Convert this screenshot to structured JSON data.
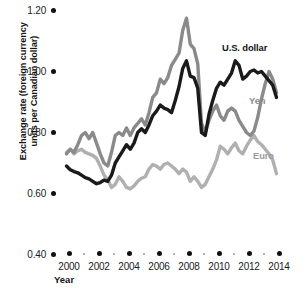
{
  "chart_data": {
    "type": "line",
    "title": "",
    "xlabel": "Year",
    "ylabel": "Exchange rate (foreign currency\nunits per Canadian dollar)",
    "xlim": [
      1999.6,
      2014.4
    ],
    "ylim": [
      0.4,
      1.2
    ],
    "yticks": [
      "0.40",
      "0.60",
      "0.80",
      "1.00",
      "1.20"
    ],
    "ytick_values": [
      0.4,
      0.6,
      0.8,
      1.0,
      1.2
    ],
    "xticks": [
      "2000",
      "2002",
      "2004",
      "2006",
      "2008",
      "2010",
      "2012",
      "2014"
    ],
    "xtick_values": [
      2000,
      2002,
      2004,
      2006,
      2008,
      2010,
      2012,
      2014
    ],
    "xminor_values": [
      2001,
      2003,
      2005,
      2007,
      2009,
      2011,
      2013
    ],
    "grid": false,
    "legend": "inline-annotations",
    "colors": {
      "us_dollar": "#1a1a1a",
      "yen": "#8a8a8a",
      "euro": "#b0b0b0",
      "text": "#141414",
      "background": "#ffffff"
    },
    "series": [
      {
        "name": "U.S. dollar",
        "color": "#1a1a1a",
        "x": [
          2000.0,
          2000.25,
          2000.5,
          2000.75,
          2001.0,
          2001.25,
          2001.5,
          2001.75,
          2002.0,
          2002.25,
          2002.5,
          2002.75,
          2003.0,
          2003.25,
          2003.5,
          2003.75,
          2004.0,
          2004.25,
          2004.5,
          2004.75,
          2005.0,
          2005.25,
          2005.5,
          2005.75,
          2006.0,
          2006.25,
          2006.5,
          2006.75,
          2007.0,
          2007.25,
          2007.5,
          2007.75,
          2008.0,
          2008.25,
          2008.5,
          2008.75,
          2009.0,
          2009.25,
          2009.5,
          2009.75,
          2010.0,
          2010.25,
          2010.5,
          2010.75,
          2011.0,
          2011.25,
          2011.5,
          2011.75,
          2012.0,
          2012.25,
          2012.5,
          2012.75,
          2013.0,
          2013.25,
          2013.5,
          2013.75,
          2014.0
        ],
        "values": [
          0.69,
          0.678,
          0.672,
          0.668,
          0.66,
          0.652,
          0.648,
          0.64,
          0.632,
          0.636,
          0.644,
          0.64,
          0.66,
          0.7,
          0.72,
          0.74,
          0.76,
          0.745,
          0.765,
          0.8,
          0.812,
          0.8,
          0.825,
          0.855,
          0.87,
          0.89,
          0.88,
          0.875,
          0.865,
          0.905,
          0.95,
          1.01,
          1.035,
          0.985,
          0.98,
          0.945,
          0.8,
          0.79,
          0.86,
          0.905,
          0.945,
          0.965,
          0.955,
          0.975,
          0.995,
          1.035,
          1.02,
          0.975,
          0.985,
          1.0,
          1.005,
          0.995,
          1.0,
          0.985,
          0.97,
          0.955,
          0.915
        ]
      },
      {
        "name": "Yen",
        "color": "#8a8a8a",
        "x": [
          2000.0,
          2000.25,
          2000.5,
          2000.75,
          2001.0,
          2001.25,
          2001.5,
          2001.75,
          2002.0,
          2002.25,
          2002.5,
          2002.75,
          2003.0,
          2003.25,
          2003.5,
          2003.75,
          2004.0,
          2004.25,
          2004.5,
          2004.75,
          2005.0,
          2005.25,
          2005.5,
          2005.75,
          2006.0,
          2006.25,
          2006.5,
          2006.75,
          2007.0,
          2007.25,
          2007.5,
          2007.75,
          2008.0,
          2008.25,
          2008.5,
          2008.75,
          2009.0,
          2009.25,
          2009.5,
          2009.75,
          2010.0,
          2010.25,
          2010.5,
          2010.75,
          2011.0,
          2011.25,
          2011.5,
          2011.75,
          2012.0,
          2012.25,
          2012.5,
          2012.75,
          2013.0,
          2013.25,
          2013.5,
          2013.75,
          2014.0
        ],
        "values": [
          0.73,
          0.745,
          0.735,
          0.76,
          0.79,
          0.8,
          0.78,
          0.8,
          0.765,
          0.73,
          0.7,
          0.69,
          0.735,
          0.79,
          0.8,
          0.79,
          0.815,
          0.79,
          0.815,
          0.83,
          0.845,
          0.825,
          0.865,
          0.915,
          0.93,
          0.975,
          0.96,
          0.98,
          1.02,
          1.04,
          1.06,
          1.135,
          1.175,
          1.09,
          1.075,
          1.025,
          0.83,
          0.8,
          0.84,
          0.87,
          0.89,
          0.855,
          0.84,
          0.87,
          0.88,
          0.87,
          0.84,
          0.82,
          0.8,
          0.79,
          0.805,
          0.85,
          0.91,
          0.96,
          1.0,
          0.975,
          0.93
        ]
      },
      {
        "name": "Euro",
        "color": "#b0b0b0",
        "x": [
          2000.0,
          2000.25,
          2000.5,
          2000.75,
          2001.0,
          2001.25,
          2001.5,
          2001.75,
          2002.0,
          2002.25,
          2002.5,
          2002.75,
          2003.0,
          2003.25,
          2003.5,
          2003.75,
          2004.0,
          2004.25,
          2004.5,
          2004.75,
          2005.0,
          2005.25,
          2005.5,
          2005.75,
          2006.0,
          2006.25,
          2006.5,
          2006.75,
          2007.0,
          2007.25,
          2007.5,
          2007.75,
          2008.0,
          2008.25,
          2008.5,
          2008.75,
          2009.0,
          2009.25,
          2009.5,
          2009.75,
          2010.0,
          2010.25,
          2010.5,
          2010.75,
          2011.0,
          2011.25,
          2011.5,
          2011.75,
          2012.0,
          2012.25,
          2012.5,
          2012.75,
          2013.0,
          2013.25,
          2013.5,
          2013.75,
          2014.0
        ],
        "values": [
          0.735,
          0.745,
          0.73,
          0.74,
          0.745,
          0.735,
          0.73,
          0.725,
          0.715,
          0.69,
          0.66,
          0.645,
          0.62,
          0.63,
          0.655,
          0.64,
          0.62,
          0.615,
          0.625,
          0.64,
          0.65,
          0.655,
          0.68,
          0.695,
          0.69,
          0.68,
          0.695,
          0.7,
          0.69,
          0.68,
          0.665,
          0.68,
          0.67,
          0.64,
          0.655,
          0.64,
          0.62,
          0.63,
          0.655,
          0.68,
          0.71,
          0.755,
          0.745,
          0.73,
          0.75,
          0.765,
          0.74,
          0.73,
          0.755,
          0.775,
          0.79,
          0.77,
          0.76,
          0.745,
          0.73,
          0.71,
          0.665
        ]
      }
    ]
  },
  "annotations": {
    "us_dollar_label": "U.S. dollar",
    "yen_label": "Yen",
    "euro_label": "Euro"
  }
}
